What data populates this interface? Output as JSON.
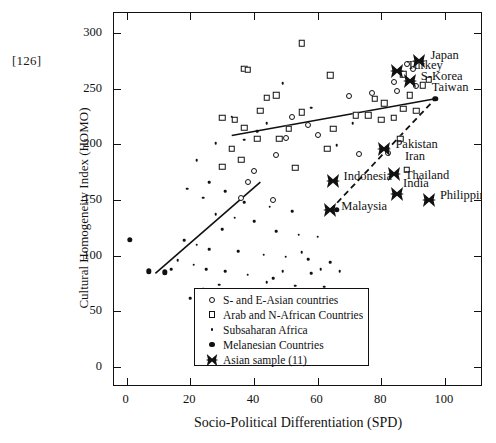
{
  "page_ref": "[126]",
  "chart_data": {
    "type": "scatter",
    "title": "",
    "xlabel": "Socio-Political Differentiation (SPD)",
    "ylabel": "Cultural Homogeneity Index (HOMO)",
    "xlim": [
      -4,
      112
    ],
    "ylim": [
      -18,
      318
    ],
    "xticks": [
      0,
      20,
      40,
      60,
      80,
      100
    ],
    "yticks": [
      0,
      50,
      100,
      150,
      200,
      250,
      300
    ],
    "grid": false,
    "legend_position": "bottom-right",
    "series": [
      {
        "name": "S- and E-Asian countries",
        "marker": "open-circle",
        "points": [
          [
            88,
            272
          ],
          [
            90,
            268
          ],
          [
            84,
            256
          ],
          [
            91,
            252
          ],
          [
            85,
            248
          ],
          [
            77,
            246
          ],
          [
            70,
            243
          ],
          [
            52,
            225
          ],
          [
            57,
            217
          ],
          [
            50,
            206
          ],
          [
            60,
            208
          ],
          [
            47,
            190
          ],
          [
            82,
            192
          ],
          [
            73,
            191
          ],
          [
            40,
            176
          ],
          [
            38,
            166
          ],
          [
            36,
            152
          ],
          [
            46,
            150
          ]
        ]
      },
      {
        "name": "Arab and N-African Countries",
        "marker": "open-square",
        "points": [
          [
            55,
            291
          ],
          [
            37,
            268
          ],
          [
            38,
            267
          ],
          [
            64,
            262
          ],
          [
            87,
            263
          ],
          [
            95,
            258
          ],
          [
            93,
            253
          ],
          [
            89,
            244
          ],
          [
            47,
            244
          ],
          [
            44,
            242
          ],
          [
            78,
            241
          ],
          [
            81,
            237
          ],
          [
            42,
            230
          ],
          [
            55,
            229
          ],
          [
            87,
            232
          ],
          [
            91,
            230
          ],
          [
            30,
            224
          ],
          [
            34,
            222
          ],
          [
            72,
            226
          ],
          [
            76,
            226
          ],
          [
            84,
            224
          ],
          [
            80,
            222
          ],
          [
            37,
            215
          ],
          [
            51,
            214
          ],
          [
            65,
            214
          ],
          [
            41,
            205
          ],
          [
            48,
            205
          ],
          [
            86,
            205
          ],
          [
            33,
            196
          ],
          [
            63,
            196
          ],
          [
            30,
            180
          ],
          [
            53,
            179
          ],
          [
            88,
            177
          ],
          [
            36,
            186
          ]
        ]
      },
      {
        "name": "Subsaharan Africa",
        "marker": "small-dot",
        "points": [
          [
            49,
            255
          ],
          [
            33,
            225
          ],
          [
            58,
            233
          ],
          [
            71,
            219
          ],
          [
            44,
            219
          ],
          [
            41,
            212
          ],
          [
            37,
            204
          ],
          [
            28,
            201
          ],
          [
            66,
            199
          ],
          [
            22,
            186
          ],
          [
            26,
            166
          ],
          [
            19,
            160
          ],
          [
            31,
            158
          ],
          [
            24,
            152
          ],
          [
            37,
            148
          ],
          [
            45,
            144
          ],
          [
            52,
            140
          ],
          [
            28,
            137
          ],
          [
            34,
            134
          ],
          [
            40,
            131
          ],
          [
            30,
            124
          ],
          [
            47,
            122
          ],
          [
            54,
            119
          ],
          [
            60,
            117
          ],
          [
            18,
            114
          ],
          [
            22,
            110
          ],
          [
            26,
            106
          ],
          [
            35,
            104
          ],
          [
            43,
            101
          ],
          [
            50,
            99
          ],
          [
            57,
            97
          ],
          [
            64,
            94
          ],
          [
            21,
            92
          ],
          [
            25,
            88
          ],
          [
            31,
            86
          ],
          [
            38,
            83
          ],
          [
            46,
            80
          ],
          [
            29,
            74
          ],
          [
            24,
            70
          ],
          [
            33,
            67
          ],
          [
            20,
            62
          ],
          [
            27,
            58
          ],
          [
            23,
            54
          ],
          [
            36,
            53
          ],
          [
            42,
            68
          ],
          [
            16,
            96
          ],
          [
            14,
            88
          ],
          [
            12,
            84
          ],
          [
            55,
            103
          ],
          [
            61,
            88
          ],
          [
            49,
            86
          ],
          [
            67,
            86
          ],
          [
            58,
            84
          ],
          [
            44,
            76
          ],
          [
            53,
            73
          ],
          [
            62,
            72
          ],
          [
            26,
            63
          ],
          [
            30,
            61
          ],
          [
            40,
            60
          ],
          [
            22,
            57
          ]
        ]
      },
      {
        "name": "Melanesian Countries",
        "marker": "filled-dot",
        "points": [
          [
            1,
            114
          ],
          [
            7,
            86
          ],
          [
            12,
            85
          ],
          [
            66,
            141
          ],
          [
            97,
            241
          ]
        ]
      }
    ],
    "labeled_points": [
      {
        "name": "Japan",
        "marker": "bold-x",
        "x": 92,
        "y": 275
      },
      {
        "name": "Turkey",
        "marker": "bold-x",
        "x": 85,
        "y": 266
      },
      {
        "name": "S-Korea",
        "marker": "bold-x",
        "x": 89,
        "y": 257
      },
      {
        "name": "Taiwan",
        "marker": "bold-x",
        "x": 89,
        "y": 257
      },
      {
        "name": "Pakistan",
        "marker": "bold-x",
        "x": 81,
        "y": 196
      },
      {
        "name": "Iran",
        "marker": "bold-x",
        "x": 84,
        "y": 181
      },
      {
        "name": "Thailand",
        "marker": "bold-x",
        "x": 84,
        "y": 173
      },
      {
        "name": "Indonesia",
        "marker": "bold-x",
        "x": 65,
        "y": 167
      },
      {
        "name": "India",
        "marker": "bold-x",
        "x": 85,
        "y": 155
      },
      {
        "name": "Philippines",
        "marker": "bold-x",
        "x": 95,
        "y": 150
      },
      {
        "name": "Malaysia",
        "marker": "bold-x",
        "x": 64,
        "y": 141
      }
    ],
    "trend_lines": [
      {
        "name": "upper-solid",
        "style": "solid",
        "x1": 33,
        "y1": 208,
        "x2": 97,
        "y2": 241
      },
      {
        "name": "lower-solid",
        "style": "solid",
        "x1": 9,
        "y1": 84,
        "x2": 42,
        "y2": 166
      },
      {
        "name": "asian-dashed",
        "style": "dashed",
        "x1": 64,
        "y1": 141,
        "x2": 97,
        "y2": 241
      }
    ],
    "legend": [
      {
        "marker": "open-circle",
        "label": "S- and E-Asian countries"
      },
      {
        "marker": "open-square",
        "label": "Arab and N-African Countries"
      },
      {
        "marker": "small-dot",
        "label": "Subsaharan Africa"
      },
      {
        "marker": "filled-dot",
        "label": "Melanesian Countries"
      },
      {
        "marker": "bold-x",
        "label": "Asian sample (11)"
      }
    ]
  }
}
